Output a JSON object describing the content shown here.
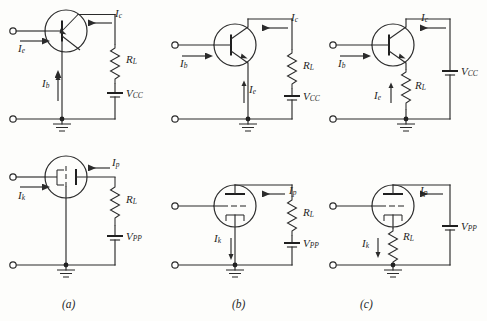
{
  "figure": {
    "width": 487,
    "height": 321,
    "background_color": "#fdfdfb",
    "line_color": "#2b2b2b",
    "rows": [
      "transistor",
      "vacuum-tube"
    ],
    "captions": [
      {
        "id": "caption-a",
        "text": "(a)"
      },
      {
        "id": "caption-b",
        "text": "(b)"
      },
      {
        "id": "caption-c",
        "text": "(c)"
      }
    ]
  },
  "panels": {
    "a_top": {
      "name": "common-base-transistor",
      "device": "transistor",
      "labels": {
        "input_current": "I",
        "input_current_sub": "e",
        "output_current": "I",
        "output_current_sub": "c",
        "common_current": "I",
        "common_current_sub": "b",
        "resistor": "R",
        "resistor_sub": "L",
        "supply": "V",
        "supply_sub": "CC"
      }
    },
    "b_top": {
      "name": "common-emitter-transistor",
      "device": "transistor",
      "labels": {
        "input_current": "I",
        "input_current_sub": "b",
        "output_current": "I",
        "output_current_sub": "c",
        "common_current": "I",
        "common_current_sub": "e",
        "resistor": "R",
        "resistor_sub": "L",
        "supply": "V",
        "supply_sub": "CC"
      }
    },
    "c_top": {
      "name": "common-collector-transistor",
      "device": "transistor",
      "labels": {
        "input_current": "I",
        "input_current_sub": "b",
        "output_current": "I",
        "output_current_sub": "c",
        "common_current": "I",
        "common_current_sub": "e",
        "resistor": "R",
        "resistor_sub": "L",
        "supply": "V",
        "supply_sub": "CC"
      }
    },
    "a_bot": {
      "name": "grounded-grid-tube",
      "device": "vacuum-tube",
      "labels": {
        "input_current": "I",
        "input_current_sub": "k",
        "output_current": "I",
        "output_current_sub": "p",
        "resistor": "R",
        "resistor_sub": "L",
        "supply": "V",
        "supply_sub": "PP"
      }
    },
    "b_bot": {
      "name": "grounded-cathode-tube",
      "device": "vacuum-tube",
      "labels": {
        "input_current": "I",
        "input_current_sub": "k",
        "output_current": "I",
        "output_current_sub": "p",
        "resistor": "R",
        "resistor_sub": "L",
        "supply": "V",
        "supply_sub": "PP"
      }
    },
    "c_bot": {
      "name": "cathode-follower-tube",
      "device": "vacuum-tube",
      "labels": {
        "input_current": "I",
        "input_current_sub": "k",
        "output_current": "I",
        "output_current_sub": "p",
        "resistor": "R",
        "resistor_sub": "L",
        "supply": "V",
        "supply_sub": "PP"
      }
    }
  }
}
